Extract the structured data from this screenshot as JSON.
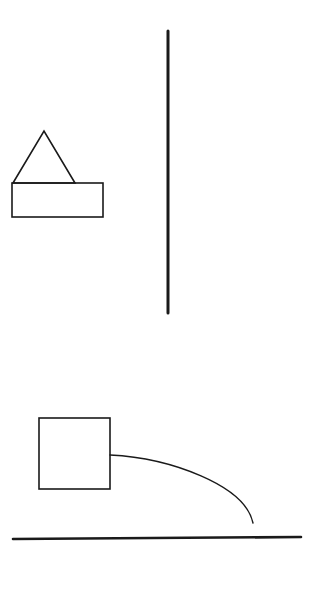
{
  "canvas": {
    "width": 332,
    "height": 598,
    "background": "#ffffff",
    "stroke": "#1a1a1a"
  },
  "shapes": {
    "triangle": {
      "points": "13,183 44,131 75,183",
      "stroke_width": 1.6
    },
    "top_rect": {
      "x": 12,
      "y": 183,
      "width": 91,
      "height": 34,
      "stroke_width": 1.6
    },
    "vertical_line": {
      "x1": 168,
      "y1": 31,
      "x2": 168,
      "y2": 313,
      "stroke_width": 3
    },
    "square": {
      "x": 39,
      "y": 418,
      "width": 71,
      "height": 71,
      "stroke_width": 1.6
    },
    "curve": {
      "d": "M110,455 C170,458 245,485 253,523",
      "stroke_width": 1.4
    },
    "ground_line": {
      "x1": 13,
      "y1": 539,
      "x2": 301,
      "y2": 537,
      "stroke_width": 2.6
    }
  }
}
